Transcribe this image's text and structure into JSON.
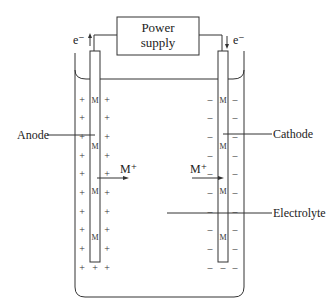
{
  "diagram": {
    "type": "electrolytic-cell",
    "power_supply": {
      "line1": "Power",
      "line2": "supply"
    },
    "electron_left": "e⁻",
    "electron_right": "e⁻",
    "labels": {
      "anode": "Anode",
      "cathode": "Cathode",
      "electrolyte": "Electrolyte"
    },
    "ion_left": "M⁺",
    "ion_right": "M⁺",
    "metal_symbol": "M",
    "plus": "+",
    "minus": "–",
    "colors": {
      "line": "#333333",
      "text": "#222222",
      "background": "#ffffff"
    }
  }
}
